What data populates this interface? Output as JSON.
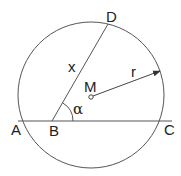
{
  "diagram": {
    "points": {
      "A": "A",
      "B": "B",
      "C": "C",
      "D": "D",
      "M": "M"
    },
    "labels": {
      "chord_length": "x",
      "radius": "r",
      "angle": "α"
    },
    "colors": {
      "stroke": "#444444",
      "text": "#222222"
    }
  }
}
